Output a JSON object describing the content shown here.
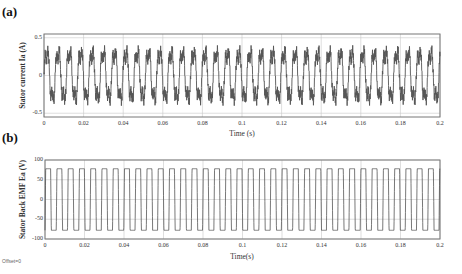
{
  "panels": [
    {
      "id": "a",
      "label": "(a)"
    },
    {
      "id": "b",
      "label": "(b)"
    }
  ],
  "footer_text": "Offset=0",
  "chart_data": [
    {
      "type": "line",
      "title": "(a)",
      "xlabel": "Time (s)",
      "ylabel": "Stator current Ia (A)",
      "xlim": [
        0,
        0.2
      ],
      "ylim": [
        -0.55,
        0.55
      ],
      "xticks": [
        0,
        0.02,
        0.04,
        0.06,
        0.08,
        0.1,
        0.12,
        0.14,
        0.16,
        0.18,
        0.2
      ],
      "xtick_labels": [
        "0",
        "0.02",
        "0.04",
        "0.06",
        "0.08",
        "0.1",
        "0.12",
        "0.14",
        "0.16",
        "0.18",
        "0.2"
      ],
      "yticks": [
        -0.5,
        0,
        0.5
      ],
      "ytick_labels": [
        "-0.5",
        "0",
        "0.5"
      ],
      "grid": true,
      "series": [
        {
          "name": "Ia",
          "description": "Distorted periodic current with switching ripple; peaks about ±0.4 A",
          "period_s": 0.0057,
          "amplitude": 0.4,
          "cycles": 35
        }
      ],
      "color": "#555555"
    },
    {
      "type": "line",
      "title": "(b)",
      "xlabel": "Time(s)",
      "ylabel": "Stator Back EMF Ea (V)",
      "xlim": [
        0,
        0.2
      ],
      "ylim": [
        -100,
        100
      ],
      "xticks": [
        0,
        0.02,
        0.04,
        0.06,
        0.08,
        0.1,
        0.12,
        0.14,
        0.16,
        0.18,
        0.2
      ],
      "xtick_labels": [
        "0",
        "0.02",
        "0.04",
        "0.06",
        "0.08",
        "0.1",
        "0.12",
        "0.14",
        "0.16",
        "0.18",
        "0.2"
      ],
      "yticks": [
        -100,
        -50,
        0,
        50,
        100
      ],
      "ytick_labels": [
        "-100",
        "-50",
        "0",
        "50",
        "100"
      ],
      "grid": true,
      "series": [
        {
          "name": "Ea",
          "description": "Trapezoidal back EMF, plateaus at about ±78 V",
          "period_s": 0.0057,
          "amplitude": 78,
          "cycles": 35
        }
      ],
      "color": "#555555"
    }
  ]
}
